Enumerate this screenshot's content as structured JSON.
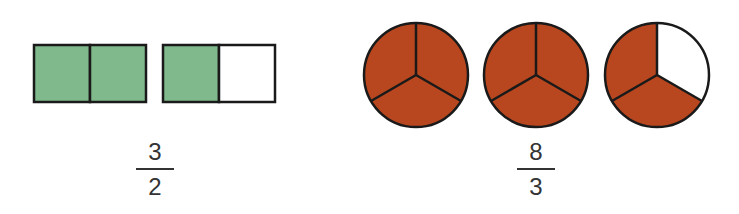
{
  "colors": {
    "rect_fill": "#7fb98c",
    "circle_fill": "#b8471f",
    "outline": "#1a1a1a",
    "empty": "#ffffff",
    "text": "#333333"
  },
  "left_model": {
    "shape": "rectangle",
    "wholes": [
      {
        "parts": 2,
        "shaded": 2
      },
      {
        "parts": 2,
        "shaded": 1
      }
    ],
    "fraction": {
      "numerator": "3",
      "denominator": "2"
    }
  },
  "right_model": {
    "shape": "circle",
    "wholes": [
      {
        "parts": 3,
        "shaded": 3
      },
      {
        "parts": 3,
        "shaded": 3
      },
      {
        "parts": 3,
        "shaded": 2
      }
    ],
    "fraction": {
      "numerator": "8",
      "denominator": "3"
    }
  }
}
